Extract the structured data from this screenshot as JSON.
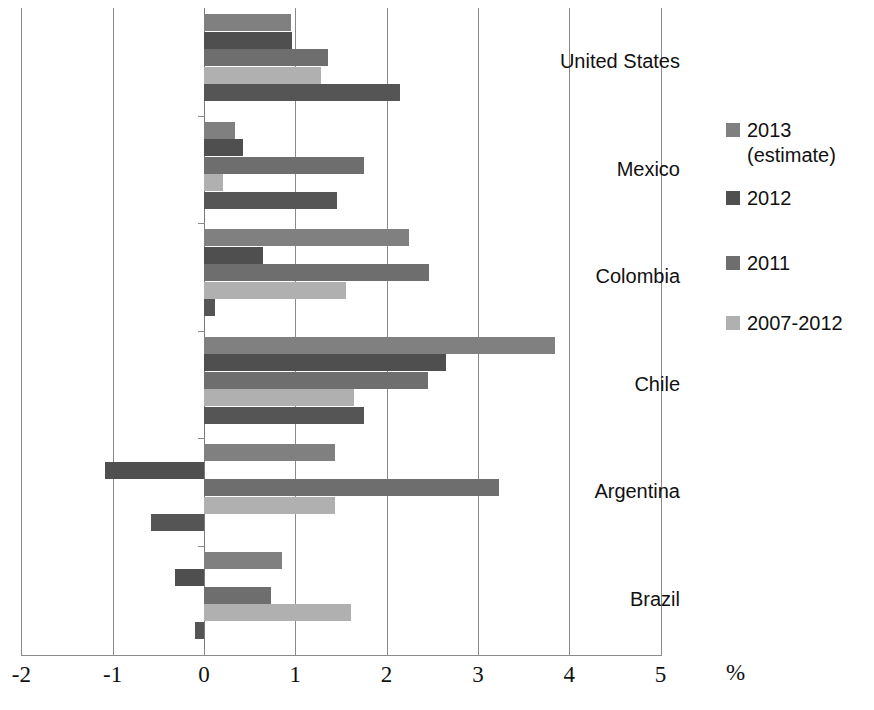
{
  "chart_data": {
    "type": "bar",
    "orientation": "horizontal",
    "title": "",
    "xlabel": "%",
    "ylabel": "",
    "xlim": [
      -2,
      5
    ],
    "xticks": [
      -2,
      -1,
      0,
      1,
      2,
      3,
      4,
      5
    ],
    "xtick_labels": [
      "-2",
      "-1",
      "0",
      "1",
      "2",
      "3",
      "4",
      "5"
    ],
    "grid": true,
    "legend_position": "right",
    "categories": [
      "United States",
      "Mexico",
      "Colombia",
      "Chile",
      "Argentina",
      "Brazil"
    ],
    "series": [
      {
        "name": "2013 (estimate)",
        "color": "#808080",
        "in_legend": true,
        "values": [
          0.95,
          0.34,
          2.24,
          3.84,
          1.43,
          0.85
        ]
      },
      {
        "name": "2012",
        "color": "#4f4f4f",
        "in_legend": true,
        "values": [
          0.96,
          0.43,
          0.65,
          2.65,
          -1.08,
          -0.32
        ]
      },
      {
        "name": "2011",
        "color": "#6e6e6e",
        "in_legend": true,
        "values": [
          1.36,
          1.75,
          2.46,
          2.45,
          3.23,
          0.73
        ]
      },
      {
        "name": "2007-2012",
        "color": "#b0b0b0",
        "in_legend": true,
        "values": [
          1.28,
          0.21,
          1.55,
          1.64,
          1.43,
          1.61
        ]
      },
      {
        "name": "",
        "color": "#555555",
        "in_legend": false,
        "values": [
          2.15,
          1.46,
          0.12,
          1.75,
          -0.58,
          -0.1
        ]
      }
    ],
    "legend_entries": [
      {
        "label": "2013\n(estimate)",
        "color": "#808080"
      },
      {
        "label": "2012",
        "color": "#4f4f4f"
      },
      {
        "label": "2011",
        "color": "#6e6e6e"
      },
      {
        "label": "2007-2012",
        "color": "#b0b0b0"
      }
    ]
  },
  "axis": {
    "unit": "%"
  }
}
